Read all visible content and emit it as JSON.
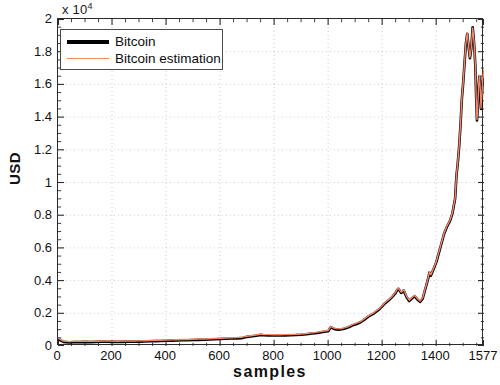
{
  "chart_data": {
    "type": "line",
    "title": "",
    "subtitle": "",
    "xlabel": "samples",
    "ylabel": "USD",
    "y_exponent_prefix": "x 10",
    "y_exponent_power": "4",
    "y_exponent_full": "x 10^4",
    "grid": true,
    "grid_style": "dotted",
    "legend_position": "top-left",
    "xlim": [
      0,
      1577
    ],
    "ylim": [
      0,
      20000
    ],
    "xticks": [
      0,
      200,
      400,
      600,
      800,
      1000,
      1200,
      1400,
      1577
    ],
    "xticklabels": [
      "0",
      "200",
      "400",
      "600",
      "800",
      "1000",
      "1200",
      "1400",
      "1577"
    ],
    "yticks": [
      0,
      2000,
      4000,
      6000,
      8000,
      10000,
      12000,
      14000,
      16000,
      18000,
      20000
    ],
    "yticklabels": [
      "0",
      "0.2",
      "0.4",
      "0.6",
      "0.8",
      "1",
      "1.2",
      "1.4",
      "1.6",
      "1.8",
      "2"
    ],
    "series": [
      {
        "name": "Bitcoin",
        "color": "#000000",
        "linewidth": 2.6,
        "x": [
          0,
          20,
          40,
          60,
          80,
          100,
          120,
          140,
          160,
          180,
          200,
          220,
          240,
          260,
          280,
          300,
          320,
          340,
          360,
          380,
          400,
          420,
          440,
          460,
          480,
          500,
          520,
          540,
          560,
          580,
          600,
          620,
          640,
          660,
          680,
          700,
          720,
          740,
          750,
          760,
          780,
          800,
          820,
          840,
          860,
          880,
          900,
          920,
          940,
          960,
          980,
          1000,
          1010,
          1020,
          1030,
          1040,
          1050,
          1060,
          1070,
          1080,
          1090,
          1100,
          1110,
          1120,
          1130,
          1140,
          1150,
          1160,
          1170,
          1180,
          1190,
          1200,
          1210,
          1220,
          1230,
          1240,
          1250,
          1255,
          1260,
          1265,
          1270,
          1275,
          1280,
          1290,
          1300,
          1310,
          1320,
          1330,
          1340,
          1350,
          1360,
          1370,
          1375,
          1380,
          1390,
          1400,
          1410,
          1420,
          1430,
          1440,
          1450,
          1460,
          1470,
          1475,
          1480,
          1485,
          1490,
          1495,
          1500,
          1505,
          1510,
          1515,
          1520,
          1525,
          1530,
          1535,
          1540,
          1545,
          1548,
          1551,
          1554,
          1557,
          1560,
          1563,
          1566,
          1569,
          1572,
          1575,
          1577
        ],
        "y": [
          430,
          250,
          220,
          240,
          235,
          250,
          240,
          250,
          265,
          260,
          255,
          250,
          255,
          270,
          265,
          270,
          280,
          290,
          300,
          310,
          320,
          330,
          340,
          350,
          355,
          365,
          375,
          385,
          400,
          415,
          430,
          445,
          455,
          465,
          480,
          560,
          600,
          640,
          680,
          660,
          650,
          640,
          645,
          650,
          660,
          670,
          690,
          720,
          760,
          800,
          860,
          900,
          1150,
          1060,
          1010,
          1000,
          1020,
          1060,
          1110,
          1180,
          1260,
          1320,
          1380,
          1450,
          1560,
          1690,
          1810,
          1900,
          2000,
          2130,
          2250,
          2420,
          2600,
          2740,
          2880,
          3050,
          3250,
          3420,
          3500,
          3380,
          3250,
          3300,
          3400,
          3000,
          2750,
          2900,
          3050,
          2850,
          2700,
          2900,
          3500,
          4100,
          4500,
          4300,
          4700,
          5100,
          5700,
          6300,
          6900,
          7300,
          7600,
          8100,
          9000,
          10400,
          11200,
          12200,
          13500,
          15100,
          16100,
          17300,
          18500,
          19100,
          18300,
          17600,
          18200,
          19500,
          18600,
          17100,
          15200,
          13800,
          14600,
          15900,
          16500,
          15700,
          14500,
          15300,
          16200,
          16800,
          16400
        ]
      },
      {
        "name": "Bitcoin estimation",
        "color": "#f4876a",
        "linewidth": 1.4,
        "x": [
          0,
          20,
          40,
          60,
          80,
          100,
          120,
          140,
          160,
          180,
          200,
          220,
          240,
          260,
          280,
          300,
          320,
          340,
          360,
          380,
          400,
          420,
          440,
          460,
          480,
          500,
          520,
          540,
          560,
          580,
          600,
          620,
          640,
          660,
          680,
          700,
          720,
          740,
          750,
          760,
          780,
          800,
          820,
          840,
          860,
          880,
          900,
          920,
          940,
          960,
          980,
          1000,
          1010,
          1020,
          1030,
          1040,
          1050,
          1060,
          1070,
          1080,
          1090,
          1100,
          1110,
          1120,
          1130,
          1140,
          1150,
          1160,
          1170,
          1180,
          1190,
          1200,
          1210,
          1220,
          1230,
          1240,
          1250,
          1255,
          1260,
          1265,
          1270,
          1275,
          1280,
          1290,
          1300,
          1310,
          1320,
          1330,
          1340,
          1350,
          1360,
          1370,
          1375,
          1380,
          1390,
          1400,
          1410,
          1420,
          1430,
          1440,
          1450,
          1460,
          1470,
          1475,
          1480,
          1485,
          1490,
          1495,
          1500,
          1505,
          1510,
          1515,
          1520,
          1525,
          1530,
          1535,
          1540,
          1545,
          1548,
          1551,
          1554,
          1557,
          1560,
          1563,
          1566,
          1569,
          1572,
          1575,
          1577
        ],
        "y": [
          470,
          300,
          265,
          280,
          280,
          290,
          285,
          295,
          305,
          300,
          300,
          295,
          300,
          310,
          305,
          315,
          325,
          335,
          345,
          355,
          365,
          375,
          385,
          395,
          400,
          410,
          420,
          430,
          445,
          460,
          475,
          490,
          500,
          510,
          525,
          600,
          645,
          690,
          725,
          705,
          695,
          685,
          690,
          695,
          705,
          715,
          735,
          765,
          805,
          845,
          905,
          950,
          1190,
          1110,
          1060,
          1050,
          1070,
          1105,
          1155,
          1225,
          1305,
          1365,
          1425,
          1495,
          1605,
          1735,
          1855,
          1945,
          2045,
          2175,
          2295,
          2465,
          2645,
          2785,
          2925,
          3095,
          3295,
          3465,
          3545,
          3425,
          3295,
          3345,
          3445,
          3055,
          2805,
          2950,
          3100,
          2905,
          2755,
          2950,
          3545,
          4145,
          4545,
          4350,
          4745,
          5145,
          5745,
          6345,
          6945,
          7345,
          7645,
          8145,
          9045,
          10445,
          11245,
          12245,
          13545,
          15145,
          16145,
          17345,
          18545,
          19145,
          18345,
          17645,
          18245,
          19450,
          18650,
          17150,
          15250,
          13850,
          14650,
          15950,
          16550,
          15750,
          14550,
          15350,
          16250,
          16850,
          16450
        ]
      }
    ]
  },
  "legend": {
    "items": [
      {
        "label": "Bitcoin",
        "style": "thick",
        "color": "#000000"
      },
      {
        "label": "Bitcoin estimation",
        "style": "thin",
        "color": "#f4876a"
      }
    ]
  },
  "axes": {
    "ylabel": "USD",
    "xlabel": "samples",
    "exponent_prefix": "x 10",
    "exponent_power": "4"
  }
}
